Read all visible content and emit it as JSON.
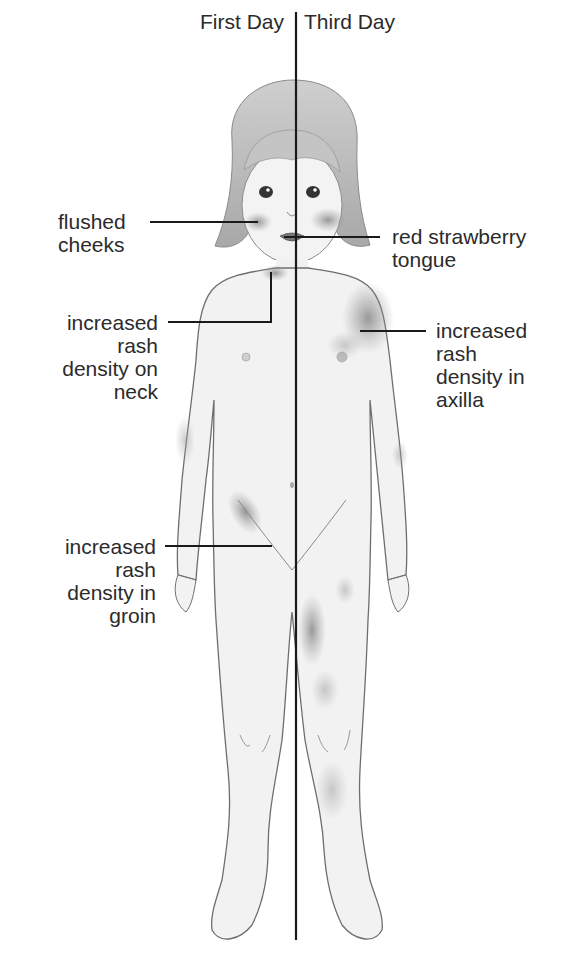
{
  "diagram": {
    "headers": {
      "left": "First Day",
      "right": "Third Day"
    },
    "labels": {
      "flushed_cheeks": "flushed\ncheeks",
      "strawberry_tongue": "red strawberry\ntongue",
      "neck_rash": "increased\nrash\ndensity on\nneck",
      "axilla_rash": "increased\nrash\ndensity in\naxilla",
      "groin_rash": "increased\nrash\ndensity in\ngroin"
    },
    "colors": {
      "line": "#1a1a1a",
      "skin": "#f1f1f1",
      "outline": "#6e6e6e",
      "hair": "#bdbdbd",
      "rash": "#8a8a8a",
      "text": "#2b2b2b"
    }
  }
}
